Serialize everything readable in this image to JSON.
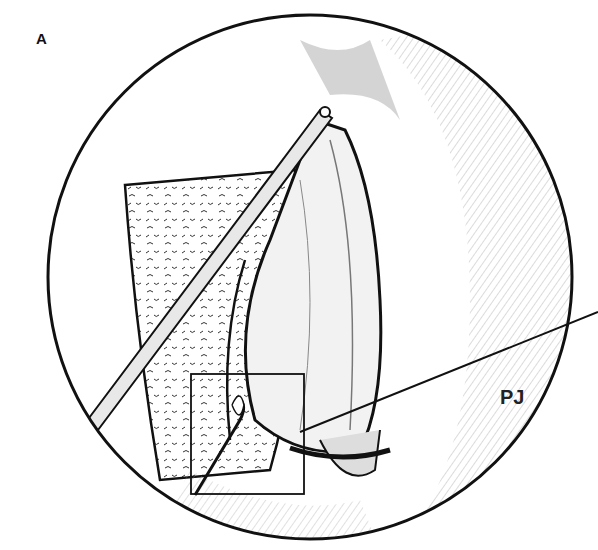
{
  "figure": {
    "panel_label": "A",
    "signature": "PJ",
    "colors": {
      "ink": "#1a1a1a",
      "background": "#ffffff",
      "shading": "#888888"
    }
  }
}
